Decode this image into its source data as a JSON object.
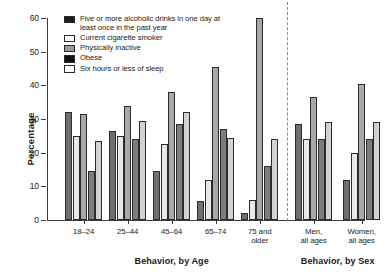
{
  "chart_data": {
    "type": "bar",
    "title": "",
    "xlabel": "",
    "ylabel": "Percentage",
    "ylim": [
      0,
      60
    ],
    "ytick_labels": [
      "0",
      "10",
      "20",
      "30",
      "40",
      "50",
      "60"
    ],
    "ytick_values": [
      0,
      10,
      20,
      30,
      40,
      50,
      60
    ],
    "grid": false,
    "legend_position": "top-center",
    "categories": [
      "18–24",
      "25–44",
      "45–64",
      "65–74",
      "75 and older",
      "Men, all ages",
      "Women, all ages"
    ],
    "series": [
      {
        "name": "Five or more alcoholic drinks in one day at least once in the past year",
        "values": [
          32.0,
          26.5,
          14.5,
          5.5,
          2.0,
          28.5,
          12.0
        ]
      },
      {
        "name": "Current cigarette smoker",
        "values": [
          25.0,
          25.0,
          22.5,
          12.0,
          6.0,
          24.0,
          20.0
        ]
      },
      {
        "name": "Physically inactive",
        "values": [
          31.5,
          34.0,
          38.0,
          45.5,
          60.0,
          36.5,
          40.5
        ]
      },
      {
        "name": "Obese",
        "values": [
          14.5,
          24.0,
          28.5,
          27.0,
          16.0,
          24.0,
          24.0
        ]
      },
      {
        "name": "Six hours or less of sleep",
        "values": [
          23.5,
          29.5,
          32.0,
          24.5,
          24.0,
          29.0,
          29.0
        ]
      }
    ],
    "annotations": {
      "section_age": "Behavior, by Age",
      "section_sex": "Behavior, by Sex",
      "divider": "dashed-vertical-separator"
    }
  },
  "legend": {
    "items": [
      {
        "label": "Five or more alcoholic drinks in one day at least once in the past year",
        "swatch": "legend-swatch-dark-solid"
      },
      {
        "label": "Current cigarette smoker",
        "swatch": "legend-swatch-white-outline"
      },
      {
        "label": "Physically inactive",
        "swatch": "legend-swatch-gray-textured"
      },
      {
        "label": "Obese",
        "swatch": "legend-swatch-black-solid"
      },
      {
        "label": "Six hours or less of sleep",
        "swatch": "legend-swatch-white-outline"
      }
    ]
  },
  "axes": {
    "y_title": "Percentage",
    "x_group_labels": [
      {
        "line1": "18–24",
        "line2": ""
      },
      {
        "line1": "25–44",
        "line2": ""
      },
      {
        "line1": "45–64",
        "line2": ""
      },
      {
        "line1": "65–74",
        "line2": ""
      },
      {
        "line1": "75 and",
        "line2": "older"
      },
      {
        "line1": "Men,",
        "line2": "all ages"
      },
      {
        "line1": "Women,",
        "line2": "all ages"
      }
    ],
    "section_age_title": "Behavior, by Age",
    "section_sex_title": "Behavior, by Sex"
  },
  "colors": {
    "series_0": "#6f6f6f",
    "series_1": "#e8e8e8",
    "series_2": "#a8a8a8",
    "series_3": "#7d7d7d",
    "series_4": "#d2d2d2",
    "axis": "#3a3a3a",
    "background": "#ffffff"
  }
}
